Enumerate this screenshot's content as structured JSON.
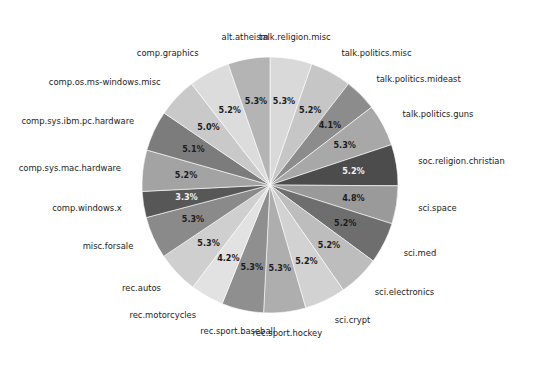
{
  "chart_data": {
    "type": "pie",
    "title": "",
    "subtitle": "",
    "xlabel": "",
    "ylabel": "",
    "grid": false,
    "legend_position": "none",
    "label_style": "radial-outside",
    "autopct_format": "%.1f%%",
    "start_angle_deg": 90,
    "direction": "clockwise",
    "background_color": "#ffffff",
    "label_text_color": "#1a1a1a",
    "categories": [
      "talk.religion.misc",
      "talk.politics.misc",
      "talk.politics.mideast",
      "talk.politics.guns",
      "soc.religion.christian",
      "sci.space",
      "sci.med",
      "sci.electronics",
      "sci.crypt",
      "rec.sport.hockey",
      "rec.sport.baseball",
      "rec.motorcycles",
      "rec.autos",
      "misc.forsale",
      "comp.windows.x",
      "comp.sys.mac.hardware",
      "comp.sys.ibm.pc.hardware",
      "comp.os.ms-windows.misc",
      "comp.graphics",
      "alt.atheism"
    ],
    "values": [
      5.3,
      5.2,
      4.1,
      5.3,
      5.2,
      4.8,
      5.2,
      5.2,
      5.2,
      5.3,
      5.3,
      4.2,
      5.3,
      5.3,
      3.3,
      5.2,
      5.1,
      5.0,
      5.2,
      5.3
    ],
    "pct_labels": [
      "5.3%",
      "5.2%",
      "4.1%",
      "5.3%",
      "5.2%",
      "4.8%",
      "5.2%",
      "5.2%",
      "5.2%",
      "5.3%",
      "5.3%",
      "4.2%",
      "5.3%",
      "5.3%",
      "3.3%",
      "5.2%",
      "5.1%",
      "5.0%",
      "5.2%",
      "5.3%"
    ],
    "slice_colors": [
      "#d9d9d9",
      "#c6c6c6",
      "#8c8c8c",
      "#a8a8a8",
      "#4c4c4c",
      "#9a9a9a",
      "#6e6e6e",
      "#bdbdbd",
      "#d2d2d2",
      "#aeaeae",
      "#8f8f8f",
      "#e2e2e2",
      "#cfcfcf",
      "#8a8a8a",
      "#575757",
      "#a3a3a3",
      "#7c7c7c",
      "#c9c9c9",
      "#dcdcdc",
      "#b4b4b4",
      "#9e9e9e"
    ],
    "geometry": {
      "center_x": 270,
      "center_y": 185,
      "radius": 128
    }
  },
  "figure": {
    "canvas_width": 538,
    "canvas_height": 368
  }
}
